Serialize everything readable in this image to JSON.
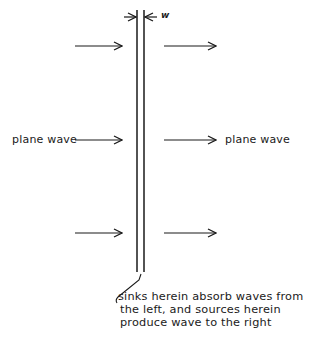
{
  "diagram": {
    "labels": {
      "left_wave": "plane wave",
      "right_wave": "plane wave",
      "thickness": "w",
      "note_lines": [
        "sinks herein absorb waves from",
        "the left, and sources herein",
        "produce wave to the right"
      ]
    },
    "colors": {
      "ink": "#1a1a1a",
      "background": "#ffffff"
    }
  }
}
